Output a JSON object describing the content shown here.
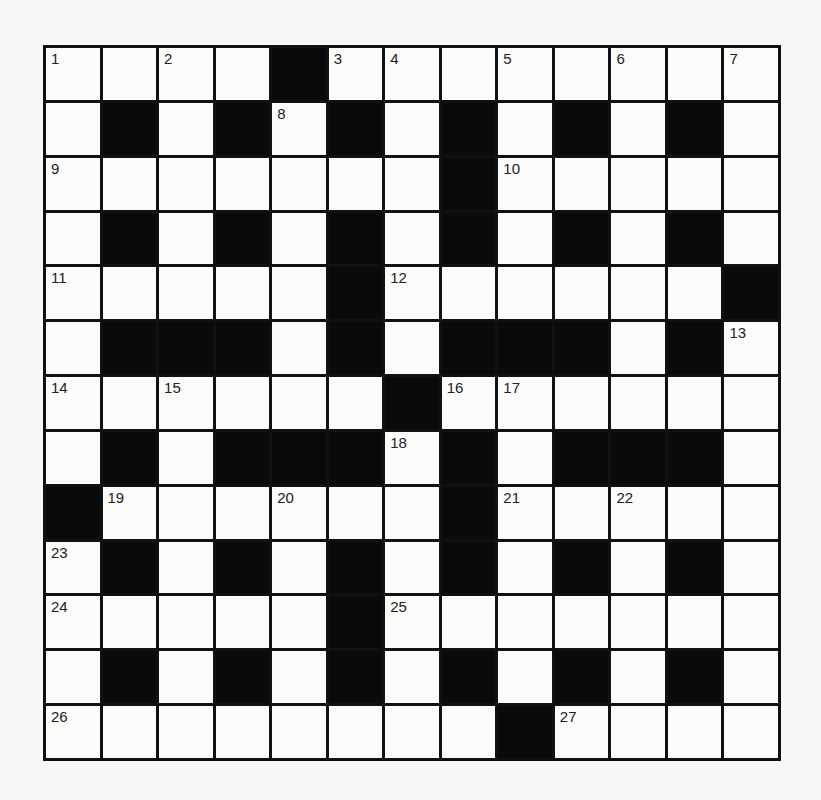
{
  "puzzle": {
    "rows": 13,
    "cols": 13,
    "grid": [
      [
        "1",
        "W",
        "2",
        "W",
        "B",
        "3",
        "4",
        "W",
        "5",
        "W",
        "6",
        "W",
        "7"
      ],
      [
        "W",
        "B",
        "W",
        "B",
        "8",
        "B",
        "W",
        "B",
        "W",
        "B",
        "W",
        "B",
        "W"
      ],
      [
        "9",
        "W",
        "W",
        "W",
        "W",
        "W",
        "W",
        "B",
        "10",
        "W",
        "W",
        "W",
        "W"
      ],
      [
        "W",
        "B",
        "W",
        "B",
        "W",
        "B",
        "W",
        "B",
        "W",
        "B",
        "W",
        "B",
        "W"
      ],
      [
        "11",
        "W",
        "W",
        "W",
        "W",
        "B",
        "12",
        "W",
        "W",
        "W",
        "W",
        "W",
        "B"
      ],
      [
        "W",
        "B",
        "B",
        "B",
        "W",
        "B",
        "W",
        "B",
        "B",
        "B",
        "W",
        "B",
        "13"
      ],
      [
        "14",
        "W",
        "15",
        "W",
        "W",
        "W",
        "B",
        "16",
        "17",
        "W",
        "W",
        "W",
        "W"
      ],
      [
        "W",
        "B",
        "W",
        "B",
        "B",
        "B",
        "18",
        "B",
        "W",
        "B",
        "B",
        "B",
        "W"
      ],
      [
        "B",
        "19",
        "W",
        "W",
        "20",
        "W",
        "W",
        "B",
        "21",
        "W",
        "22",
        "W",
        "W"
      ],
      [
        "23",
        "B",
        "W",
        "B",
        "W",
        "B",
        "W",
        "B",
        "W",
        "B",
        "W",
        "B",
        "W"
      ],
      [
        "24",
        "W",
        "W",
        "W",
        "W",
        "B",
        "25",
        "W",
        "W",
        "W",
        "W",
        "W",
        "W"
      ],
      [
        "W",
        "B",
        "W",
        "B",
        "W",
        "B",
        "W",
        "B",
        "W",
        "B",
        "W",
        "B",
        "W"
      ],
      [
        "26",
        "W",
        "W",
        "W",
        "W",
        "W",
        "W",
        "W",
        "B",
        "27",
        "W",
        "W",
        "W"
      ]
    ],
    "clue_numbers": [
      "1",
      "2",
      "3",
      "4",
      "5",
      "6",
      "7",
      "8",
      "9",
      "10",
      "11",
      "12",
      "13",
      "14",
      "15",
      "16",
      "17",
      "18",
      "19",
      "20",
      "21",
      "22",
      "23",
      "24",
      "25",
      "26",
      "27"
    ],
    "colors": {
      "black": "#0a0a0a",
      "white": "#fbfbfa",
      "border": "#111111"
    }
  }
}
